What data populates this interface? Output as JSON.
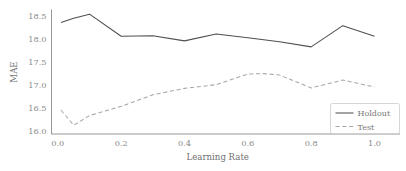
{
  "chart_data": {
    "type": "line",
    "title": "",
    "xlabel": "Learning Rate",
    "ylabel": "MAE",
    "xlim": [
      -0.02,
      1.03
    ],
    "ylim": [
      15.93,
      18.62
    ],
    "xticks": [
      0.0,
      0.2,
      0.4,
      0.6,
      0.8,
      1.0
    ],
    "xtick_labels": [
      "0.0",
      "0.2",
      "0.4",
      "0.6",
      "0.8",
      "1.0"
    ],
    "yticks": [
      16.0,
      16.5,
      17.0,
      17.5,
      18.0,
      18.5
    ],
    "ytick_labels": [
      "16.0",
      "16.5",
      "17.0",
      "17.5",
      "18.0",
      "18.5"
    ],
    "grid": false,
    "legend_position": "lower right",
    "series": [
      {
        "name": "Holdout",
        "style": "solid",
        "color": "#4f4f4f",
        "x": [
          0.01,
          0.05,
          0.1,
          0.2,
          0.3,
          0.4,
          0.5,
          0.6,
          0.7,
          0.8,
          0.9,
          1.0
        ],
        "values": [
          18.35,
          18.44,
          18.53,
          18.05,
          18.06,
          17.95,
          18.1,
          18.02,
          17.93,
          17.82,
          18.28,
          18.05
        ]
      },
      {
        "name": "Test",
        "style": "dashed",
        "color": "#a8a8a8",
        "x": [
          0.01,
          0.05,
          0.1,
          0.2,
          0.3,
          0.4,
          0.5,
          0.6,
          0.65,
          0.7,
          0.8,
          0.9,
          1.0
        ],
        "values": [
          16.45,
          16.12,
          16.33,
          16.53,
          16.78,
          16.92,
          17.0,
          17.23,
          17.24,
          17.21,
          16.93,
          17.1,
          16.95
        ]
      }
    ]
  },
  "legend": {
    "entries": [
      {
        "label": "Holdout"
      },
      {
        "label": "Test"
      }
    ]
  },
  "axes": {
    "x_title": "Learning Rate",
    "y_title": "MAE"
  }
}
